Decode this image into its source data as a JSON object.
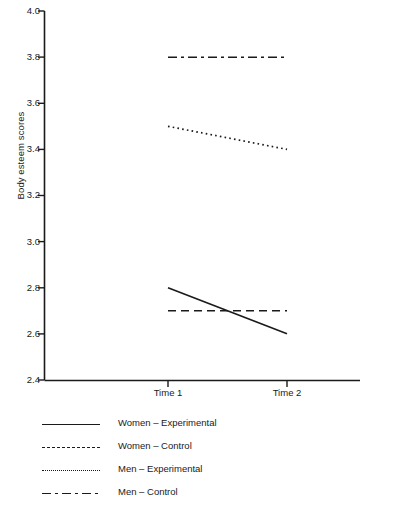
{
  "chart_data": {
    "type": "line",
    "title": "",
    "xlabel": "",
    "ylabel": "Body esteem scores",
    "x": [
      "Time 1",
      "Time 2"
    ],
    "categories": [
      "Time 1",
      "Time 2"
    ],
    "ylim": [
      2.4,
      4.0
    ],
    "yticks": [
      "2.4",
      "2.6",
      "2.8",
      "3.0",
      "3.2",
      "3.4",
      "3.6",
      "3.8",
      "4.0"
    ],
    "ytick_values": [
      2.4,
      2.6,
      2.8,
      3.0,
      3.2,
      3.4,
      3.6,
      3.8,
      4.0
    ],
    "grid": false,
    "legend_position": "below",
    "series": [
      {
        "name": "Women – Experimental",
        "style": "solid",
        "values": [
          2.8,
          2.6
        ]
      },
      {
        "name": "Women – Control",
        "style": "dashed",
        "values": [
          2.7,
          2.7
        ]
      },
      {
        "name": "Men – Experimental",
        "style": "dotted",
        "values": [
          3.5,
          3.4
        ]
      },
      {
        "name": "Men – Control",
        "style": "dashdot",
        "values": [
          3.8,
          3.8
        ]
      }
    ],
    "colors": {
      "line": "#1a1a1a",
      "axis": "#1a1a1a",
      "text": "#1a1a1a",
      "background": "#ffffff"
    }
  },
  "axes": {
    "y_label": "Body esteem scores",
    "y_ticks": [
      "4.0",
      "3.8",
      "3.6",
      "3.4",
      "3.2",
      "3.0",
      "2.8",
      "2.6",
      "2.4"
    ],
    "x_ticks": [
      "Time 1",
      "Time 2"
    ]
  },
  "legend": {
    "items": [
      {
        "label": "Women – Experimental",
        "style": "solid"
      },
      {
        "label": "Women – Control",
        "style": "dashed"
      },
      {
        "label": "Men – Experimental",
        "style": "dotted"
      },
      {
        "label": "Men – Control",
        "style": "dashdot"
      }
    ]
  }
}
